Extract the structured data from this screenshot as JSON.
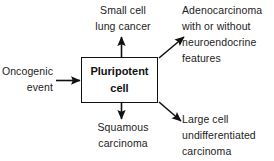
{
  "diagram": {
    "background_color": "#ffffff",
    "line_color": "#111111",
    "text_color": "#1c1c1c",
    "center_node": {
      "line1": "Pluripotent",
      "line2": "cell"
    },
    "input": {
      "label": "Oncogenic\nevent"
    },
    "outputs": {
      "top": "Small cell\nlung cancer",
      "top_right": "Adenocarcinoma\nwith or without\nneuroendocrine\nfeatures",
      "bottom": "Squamous\ncarcinoma",
      "bottom_right": "Large cell\nundifferentiated\ncarcinoma"
    }
  }
}
